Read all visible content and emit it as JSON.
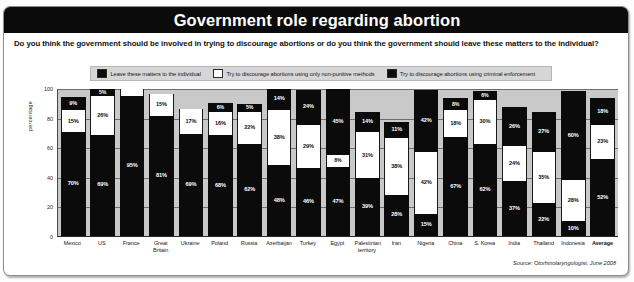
{
  "header": {
    "title": "Government role regarding abortion",
    "question": "Do you think the government should be involved in trying to discourage abortions or do you think the government should leave these matters to the individual?"
  },
  "legend": {
    "items": [
      {
        "label": "Leave these matters to the individual",
        "swatch": "black",
        "color": "#0b0b0b"
      },
      {
        "label": "Try to discourage abortions using only non-punitive methods",
        "swatch": "white",
        "color": "#ffffff"
      },
      {
        "label": "Try to discourage abortions using criminal enforcement",
        "swatch": "black",
        "color": "#0b0b0b"
      }
    ]
  },
  "footer": {
    "source": "Source: Otorhinolaryngologist, June 2008"
  },
  "chart_data": {
    "type": "bar",
    "subtype": "stacked-100",
    "title": "Government role regarding abortion",
    "subtitle": "Do you think the government should be involved in trying to discourage abortions or do you think the government should leave these matters to the individual?",
    "xlabel": "",
    "ylabel": "percentage",
    "ylim": [
      0,
      100
    ],
    "yticks": [
      100,
      80,
      60,
      40,
      20,
      0
    ],
    "grid": true,
    "legend_position": "top",
    "categories": [
      "Mexico",
      "US",
      "France",
      "Great Britain",
      "Ukraine",
      "Poland",
      "Russia",
      "Azerbaijan",
      "Turkey",
      "Egypt",
      "Palestinian territory",
      "Iran",
      "Nigeria",
      "China",
      "S. Korea",
      "India",
      "Thailand",
      "Indonesia",
      "Average"
    ],
    "series": [
      {
        "name": "Try to discourage abortions using criminal enforcement",
        "fill": "black",
        "stack_position": "top",
        "values": [
          9,
          5,
          0,
          0,
          0,
          6,
          5,
          14,
          24,
          45,
          14,
          11,
          42,
          8,
          6,
          26,
          27,
          60,
          18
        ]
      },
      {
        "name": "Try to discourage abortions using only non-punitive methods",
        "fill": "white",
        "stack_position": "middle",
        "values": [
          15,
          26,
          0,
          15,
          17,
          16,
          22,
          38,
          29,
          8,
          31,
          38,
          42,
          18,
          30,
          24,
          35,
          28,
          23
        ]
      },
      {
        "name": "Leave these matters to the individual",
        "fill": "black",
        "stack_position": "bottom",
        "values": [
          70,
          69,
          95,
          81,
          69,
          68,
          62,
          48,
          46,
          47,
          39,
          28,
          15,
          67,
          62,
          37,
          22,
          10,
          52
        ]
      }
    ],
    "bars": [
      {
        "category": "Mexico",
        "segments": [
          {
            "fill": "black",
            "label": "9%",
            "value": 9
          },
          {
            "fill": "white",
            "label": "15%",
            "value": 15
          },
          {
            "fill": "black",
            "label": "70%",
            "value": 70
          }
        ]
      },
      {
        "category": "US",
        "segments": [
          {
            "fill": "black",
            "label": "5%",
            "value": 5
          },
          {
            "fill": "white",
            "label": "26%",
            "value": 26
          },
          {
            "fill": "black",
            "label": "69%",
            "value": 69
          }
        ]
      },
      {
        "category": "France",
        "segments": [
          {
            "fill": "white",
            "label": "",
            "value": 5
          },
          {
            "fill": "black",
            "label": "95%",
            "value": 95
          }
        ]
      },
      {
        "category": "Great Britain",
        "segments": [
          {
            "fill": "white",
            "label": "15%",
            "value": 15
          },
          {
            "fill": "black",
            "label": "81%",
            "value": 81
          }
        ]
      },
      {
        "category": "Ukraine",
        "segments": [
          {
            "fill": "white",
            "label": "17%",
            "value": 17
          },
          {
            "fill": "black",
            "label": "69%",
            "value": 69
          }
        ]
      },
      {
        "category": "Poland",
        "segments": [
          {
            "fill": "black",
            "label": "6%",
            "value": 6
          },
          {
            "fill": "white",
            "label": "16%",
            "value": 16
          },
          {
            "fill": "black",
            "label": "68%",
            "value": 68
          }
        ]
      },
      {
        "category": "Russia",
        "segments": [
          {
            "fill": "black",
            "label": "5%",
            "value": 5
          },
          {
            "fill": "white",
            "label": "22%",
            "value": 22
          },
          {
            "fill": "black",
            "label": "62%",
            "value": 62
          }
        ]
      },
      {
        "category": "Azerbaijan",
        "segments": [
          {
            "fill": "black",
            "label": "14%",
            "value": 14
          },
          {
            "fill": "white",
            "label": "38%",
            "value": 38
          },
          {
            "fill": "black",
            "label": "48%",
            "value": 48
          }
        ]
      },
      {
        "category": "Turkey",
        "segments": [
          {
            "fill": "black",
            "label": "24%",
            "value": 24
          },
          {
            "fill": "white",
            "label": "29%",
            "value": 29
          },
          {
            "fill": "black",
            "label": "46%",
            "value": 46
          }
        ]
      },
      {
        "category": "Egypt",
        "segments": [
          {
            "fill": "black",
            "label": "45%",
            "value": 45
          },
          {
            "fill": "white",
            "label": "8%",
            "value": 8
          },
          {
            "fill": "black",
            "label": "47%",
            "value": 47
          }
        ]
      },
      {
        "category": "Palestinian territory",
        "segments": [
          {
            "fill": "black",
            "label": "14%",
            "value": 14
          },
          {
            "fill": "white",
            "label": "31%",
            "value": 31
          },
          {
            "fill": "black",
            "label": "39%",
            "value": 39
          }
        ]
      },
      {
        "category": "Iran",
        "segments": [
          {
            "fill": "black",
            "label": "11%",
            "value": 11
          },
          {
            "fill": "white",
            "label": "38%",
            "value": 38
          },
          {
            "fill": "black",
            "label": "28%",
            "value": 28
          }
        ]
      },
      {
        "category": "Nigeria",
        "segments": [
          {
            "fill": "black",
            "label": "42%",
            "value": 42
          },
          {
            "fill": "white",
            "label": "42%",
            "value": 42
          },
          {
            "fill": "black",
            "label": "15%",
            "value": 15
          }
        ]
      },
      {
        "category": "China",
        "segments": [
          {
            "fill": "black",
            "label": "8%",
            "value": 8
          },
          {
            "fill": "white",
            "label": "18%",
            "value": 18
          },
          {
            "fill": "black",
            "label": "67%",
            "value": 67
          }
        ]
      },
      {
        "category": "S. Korea",
        "segments": [
          {
            "fill": "black",
            "label": "6%",
            "value": 6
          },
          {
            "fill": "white",
            "label": "30%",
            "value": 30
          },
          {
            "fill": "black",
            "label": "62%",
            "value": 62
          }
        ]
      },
      {
        "category": "India",
        "segments": [
          {
            "fill": "black",
            "label": "26%",
            "value": 26
          },
          {
            "fill": "white",
            "label": "24%",
            "value": 24
          },
          {
            "fill": "black",
            "label": "37%",
            "value": 37
          }
        ]
      },
      {
        "category": "Thailand",
        "segments": [
          {
            "fill": "black",
            "label": "27%",
            "value": 27
          },
          {
            "fill": "white",
            "label": "35%",
            "value": 35
          },
          {
            "fill": "black",
            "label": "22%",
            "value": 22
          }
        ]
      },
      {
        "category": "Indonesia",
        "segments": [
          {
            "fill": "black",
            "label": "60%",
            "value": 60
          },
          {
            "fill": "white",
            "label": "28%",
            "value": 28
          },
          {
            "fill": "black",
            "label": "10%",
            "value": 10
          }
        ]
      },
      {
        "category": "Average",
        "segments": [
          {
            "fill": "black",
            "label": "18%",
            "value": 18
          },
          {
            "fill": "white",
            "label": "23%",
            "value": 23
          },
          {
            "fill": "black",
            "label": "52%",
            "value": 52
          }
        ]
      }
    ]
  }
}
